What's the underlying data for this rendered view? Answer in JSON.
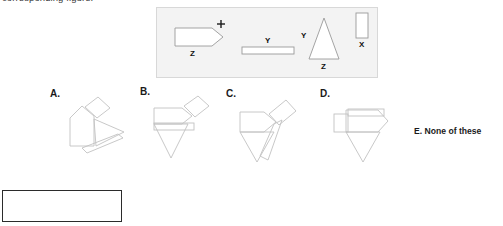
{
  "prompt": {
    "text": "corresponding figure."
  },
  "stimulus": {
    "name": "component-shapes-panel",
    "background_color": "#f3f3f3",
    "border_color": "#d8d8d8",
    "shapes": [
      {
        "id": "pentagon",
        "name": "pentagon-block",
        "label": "Z",
        "mark": "+",
        "description": "rectangle with pointed right end"
      },
      {
        "id": "bar",
        "name": "thin-bar",
        "label": "Y",
        "description": "thin horizontal rectangle"
      },
      {
        "id": "triangle",
        "name": "tall-triangle",
        "label_left": "Y",
        "label_bottom": "Z",
        "description": "tall isosceles triangle"
      },
      {
        "id": "small-rect",
        "name": "small-vertical-rectangle",
        "label": "X",
        "description": "small upright rectangle"
      }
    ]
  },
  "options": [
    {
      "id": "a",
      "label": "A.",
      "alt": "assembly option A"
    },
    {
      "id": "b",
      "label": "B.",
      "alt": "assembly option B"
    },
    {
      "id": "c",
      "label": "C.",
      "alt": "assembly option C"
    },
    {
      "id": "d",
      "label": "D.",
      "alt": "assembly option D"
    }
  ],
  "option_e": {
    "text": "E. None of these"
  },
  "answer_box": {
    "value": ""
  },
  "colors": {
    "line": "#b9b9b9",
    "line_dark": "#8f8f8f",
    "text": "#1a1a1a",
    "panel_bg": "#f3f3f3"
  }
}
